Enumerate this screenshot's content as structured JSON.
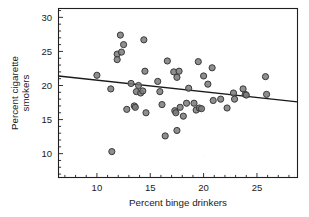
{
  "chart_data": {
    "type": "scatter",
    "title": "",
    "xlabel": "Percent binge drinkers",
    "ylabel": "Percent cigarette smokers",
    "ylabel_line1": "Percent cigarette",
    "ylabel_line2": "smokers",
    "xlim": [
      6.4,
      28.8
    ],
    "ylim": [
      6.5,
      31.3
    ],
    "grid": false,
    "legend": null,
    "xticks": [
      10,
      15,
      20,
      25
    ],
    "xtick_labels": [
      "10",
      "15",
      "20",
      "25"
    ],
    "yticks": [
      10,
      15,
      20,
      25,
      30
    ],
    "ytick_labels": [
      "10",
      "15",
      "20",
      "25",
      "30"
    ],
    "x_minor_step": 1,
    "y_minor_step": 1,
    "marker": {
      "shape": "circle",
      "radius_px": 3.1,
      "fill": "#7a7a7a",
      "edge": "#3a3a3a",
      "edge_width": 1.0
    },
    "trendline": {
      "type": "linear-fit",
      "color": "#1a1a1a",
      "width_px": 1.4,
      "x_start": 6.4,
      "y_start": 21.4,
      "x_end": 28.8,
      "y_end": 17.6
    },
    "points": [
      {
        "x": 10.0,
        "y": 21.5
      },
      {
        "x": 11.3,
        "y": 19.5
      },
      {
        "x": 11.4,
        "y": 10.3
      },
      {
        "x": 11.9,
        "y": 24.6
      },
      {
        "x": 11.9,
        "y": 23.8
      },
      {
        "x": 12.2,
        "y": 27.4
      },
      {
        "x": 12.3,
        "y": 24.9
      },
      {
        "x": 12.5,
        "y": 26.0
      },
      {
        "x": 12.8,
        "y": 16.5
      },
      {
        "x": 13.2,
        "y": 20.3
      },
      {
        "x": 13.5,
        "y": 17.0
      },
      {
        "x": 13.6,
        "y": 16.8
      },
      {
        "x": 13.7,
        "y": 19.1
      },
      {
        "x": 13.9,
        "y": 20.0
      },
      {
        "x": 14.1,
        "y": 18.9
      },
      {
        "x": 14.3,
        "y": 19.2
      },
      {
        "x": 14.5,
        "y": 22.1
      },
      {
        "x": 14.4,
        "y": 26.7
      },
      {
        "x": 14.6,
        "y": 16.0
      },
      {
        "x": 15.7,
        "y": 20.6
      },
      {
        "x": 15.9,
        "y": 19.1
      },
      {
        "x": 16.1,
        "y": 17.2
      },
      {
        "x": 16.4,
        "y": 12.6
      },
      {
        "x": 16.6,
        "y": 23.6
      },
      {
        "x": 17.2,
        "y": 22.0
      },
      {
        "x": 17.3,
        "y": 16.3
      },
      {
        "x": 17.4,
        "y": 16.0
      },
      {
        "x": 17.5,
        "y": 21.2
      },
      {
        "x": 17.5,
        "y": 13.4
      },
      {
        "x": 17.7,
        "y": 22.1
      },
      {
        "x": 17.8,
        "y": 16.8
      },
      {
        "x": 18.1,
        "y": 15.5
      },
      {
        "x": 18.4,
        "y": 17.4
      },
      {
        "x": 18.6,
        "y": 19.6
      },
      {
        "x": 19.1,
        "y": 17.4
      },
      {
        "x": 19.3,
        "y": 16.4
      },
      {
        "x": 19.5,
        "y": 23.5
      },
      {
        "x": 19.6,
        "y": 16.7
      },
      {
        "x": 19.8,
        "y": 16.6
      },
      {
        "x": 20.0,
        "y": 21.4
      },
      {
        "x": 20.4,
        "y": 20.2
      },
      {
        "x": 20.8,
        "y": 22.6
      },
      {
        "x": 20.9,
        "y": 17.8
      },
      {
        "x": 21.6,
        "y": 18.0
      },
      {
        "x": 22.2,
        "y": 16.7
      },
      {
        "x": 22.8,
        "y": 18.9
      },
      {
        "x": 22.9,
        "y": 18.0
      },
      {
        "x": 23.7,
        "y": 19.5
      },
      {
        "x": 23.9,
        "y": 18.7
      },
      {
        "x": 24.0,
        "y": 18.6
      },
      {
        "x": 25.8,
        "y": 21.3
      },
      {
        "x": 25.9,
        "y": 18.7
      }
    ]
  },
  "figure": {
    "background": "#ffffff",
    "frame_color": "#1f1f1f"
  }
}
